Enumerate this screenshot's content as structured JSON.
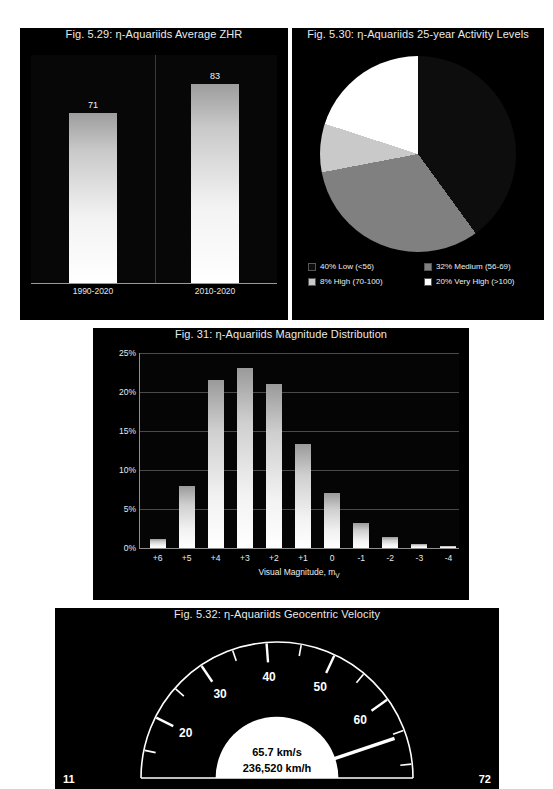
{
  "figures": {
    "zhr": {
      "title": "Fig. 5.29: η-Aquariids Average ZHR",
      "chart_data": {
        "type": "bar",
        "title": "Fig. 5.29: η-Aquariids Average ZHR",
        "categories": [
          "1990-2020",
          "2010-2020"
        ],
        "values": [
          71,
          83
        ],
        "value_labels": [
          "71",
          "83"
        ],
        "xlabel": "",
        "ylabel": "",
        "ylim": [
          0,
          95
        ],
        "grid": false
      }
    },
    "activity": {
      "title": "Fig. 5.30: η-Aquariids 25-year Activity Levels",
      "chart_data": {
        "type": "pie",
        "title": "Fig. 5.30: η-Aquariids 25-year Activity Levels",
        "legend_position": "bottom",
        "slices": [
          {
            "label": "40% Low (<56)",
            "name": "Low",
            "range": "<56",
            "value": 40,
            "color": "#0d0d0d"
          },
          {
            "label": "32% Medium (56-69)",
            "name": "Medium",
            "range": "56-69",
            "value": 32,
            "color": "#808080"
          },
          {
            "label": "8% High (70-100)",
            "name": "High",
            "range": "70-100",
            "value": 8,
            "color": "#c9c9c9"
          },
          {
            "label": "20% Very High (>100)",
            "name": "Very High",
            "range": ">100",
            "value": 20,
            "color": "#ffffff"
          }
        ]
      }
    },
    "magnitude": {
      "title": "Fig. 31: η-Aquariids Magnitude Distribution",
      "chart_data": {
        "type": "bar",
        "title": "Fig. 31: η-Aquariids Magnitude Distribution",
        "xlabel": "Visual Magnitude, m",
        "xlabel_sub": "V",
        "ylabel": "",
        "categories": [
          "+6",
          "+5",
          "+4",
          "+3",
          "+2",
          "+1",
          "0",
          "-1",
          "-2",
          "-3",
          "-4"
        ],
        "values": [
          1.2,
          8.0,
          21.6,
          23.1,
          21.0,
          13.3,
          7.0,
          3.2,
          1.4,
          0.5,
          0.3
        ],
        "ylim": [
          0,
          25
        ],
        "ytick_labels": [
          "0%",
          "5%",
          "10%",
          "15%",
          "20%",
          "25%"
        ],
        "ytick_values": [
          0,
          5,
          10,
          15,
          20,
          25
        ],
        "grid": true
      }
    },
    "velocity": {
      "title": "Fig. 5.32: η-Aquariids Geocentric Velocity",
      "chart_data": {
        "type": "gauge",
        "title": "Fig. 5.32: η-Aquariids Geocentric Velocity",
        "min": 11,
        "max": 72,
        "min_label": "11",
        "max_label": "72",
        "value": 65.7,
        "readout_primary": "65.7 km/s",
        "readout_secondary": "236,520 km/h",
        "major_ticks": [
          20,
          30,
          40,
          50,
          60
        ],
        "major_tick_labels": [
          "20",
          "30",
          "40",
          "50",
          "60"
        ],
        "minor_tick_step": 5
      }
    }
  }
}
